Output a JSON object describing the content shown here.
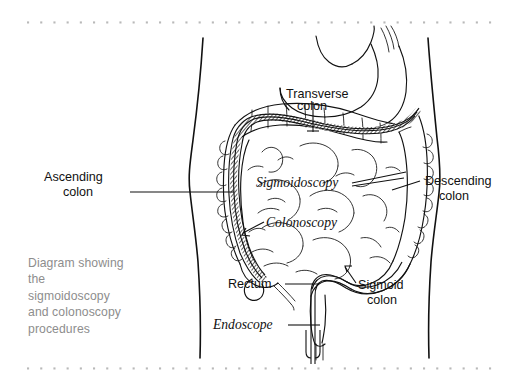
{
  "page": {
    "background_color": "#ffffff",
    "width": 523,
    "height": 384
  },
  "borders": {
    "dot_color": "#b9b9b9",
    "top_rule_name": "dotted-rule-top",
    "bottom_rule_name": "dotted-rule-bottom"
  },
  "caption": {
    "text_color": "#8d8d8d",
    "lines": [
      "Diagram showing",
      "the",
      "sigmoidoscopy",
      "and colonoscopy",
      "procedures"
    ],
    "full_text": "Diagram showing the sigmoidoscopy and colonoscopy procedures"
  },
  "diagram": {
    "title": "Sigmoidoscopy and colonoscopy procedures",
    "line_color": "#111111",
    "labels": {
      "transverse_colon": {
        "line1": "Transverse",
        "line2": "colon"
      },
      "ascending_colon": {
        "line1": "Ascending",
        "line2": "colon"
      },
      "descending_colon": {
        "line1": "Descending",
        "line2": "colon"
      },
      "sigmoid_colon": {
        "line1": "Sigmoid",
        "line2": "colon"
      },
      "rectum": {
        "line1": "Rectum"
      },
      "sigmoidoscopy": {
        "line1": "Sigmoidoscopy"
      },
      "colonoscopy": {
        "line1": "Colonoscopy"
      },
      "endoscope": {
        "line1": "Endoscope"
      }
    }
  }
}
